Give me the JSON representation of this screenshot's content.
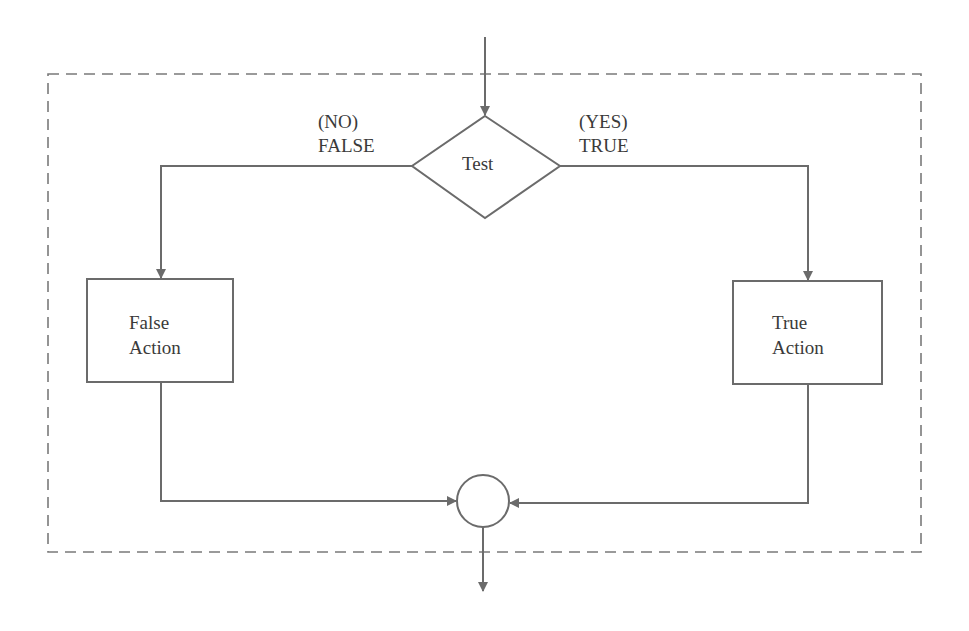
{
  "diagram": {
    "type": "flowchart",
    "title": "",
    "colors": {
      "stroke": "#6b6b6b",
      "text": "#3a3a3a",
      "background": "#ffffff"
    },
    "decision": {
      "label": "Test"
    },
    "branches": {
      "false": {
        "line1": "(NO)",
        "line2": "FALSE"
      },
      "true": {
        "line1": "(YES)",
        "line2": "TRUE"
      }
    },
    "false_action": {
      "line1": "False",
      "line2": "Action"
    },
    "true_action": {
      "line1": "True",
      "line2": "Action"
    },
    "connector": {
      "shape": "circle",
      "label": ""
    },
    "boundary": {
      "style": "dashed"
    }
  }
}
